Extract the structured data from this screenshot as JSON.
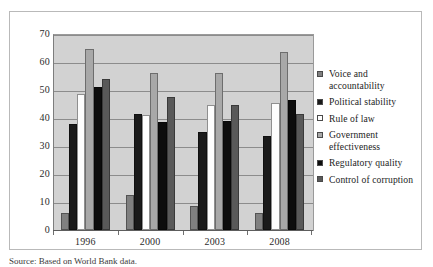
{
  "chart_data": {
    "type": "bar",
    "title": "",
    "subtitle": "",
    "xlabel": "",
    "ylabel": "",
    "categories": [
      "1996",
      "2000",
      "2003",
      "2008"
    ],
    "ylim": [
      0,
      70
    ],
    "yticks": [
      0,
      10,
      20,
      30,
      40,
      50,
      60,
      70
    ],
    "ytick_labels": [
      "0",
      "10",
      "20",
      "30",
      "40",
      "50",
      "60",
      "70"
    ],
    "grid": true,
    "grid_axis": "y",
    "legend_position": "right",
    "plot_background": "#d2d2d2",
    "series": [
      {
        "name": "Voice and accountability",
        "color": "#808080",
        "values": [
          6,
          12.5,
          8.5,
          6
        ]
      },
      {
        "name": "Political stability",
        "color": "#1a1a1a",
        "values": [
          38,
          41.5,
          35,
          33.5
        ]
      },
      {
        "name": "Rule of law",
        "color": "#fdfdfd",
        "values": [
          48.5,
          41,
          44.5,
          45.5
        ]
      },
      {
        "name": "Government effectiveness",
        "color": "#a8a8a8",
        "values": [
          64.5,
          56,
          56,
          63.5
        ]
      },
      {
        "name": "Regulatory quality",
        "color": "#0d0d0d",
        "values": [
          51,
          38.5,
          39,
          46.5
        ]
      },
      {
        "name": "Control of corruption",
        "color": "#595959",
        "values": [
          54,
          47.5,
          44.5,
          41.5
        ]
      }
    ]
  },
  "legend": {
    "items": [
      {
        "label": "Voice and accountability",
        "color": "#808080"
      },
      {
        "label": "Political stability",
        "color": "#1a1a1a"
      },
      {
        "label": "Rule of law",
        "color": "#fdfdfd"
      },
      {
        "label": "Government effectiveness",
        "color": "#a8a8a8"
      },
      {
        "label": "Regulatory quality",
        "color": "#0d0d0d"
      },
      {
        "label": "Control of corruption",
        "color": "#595959"
      }
    ]
  },
  "caption": {
    "text": "Source: Based on World Bank data."
  }
}
